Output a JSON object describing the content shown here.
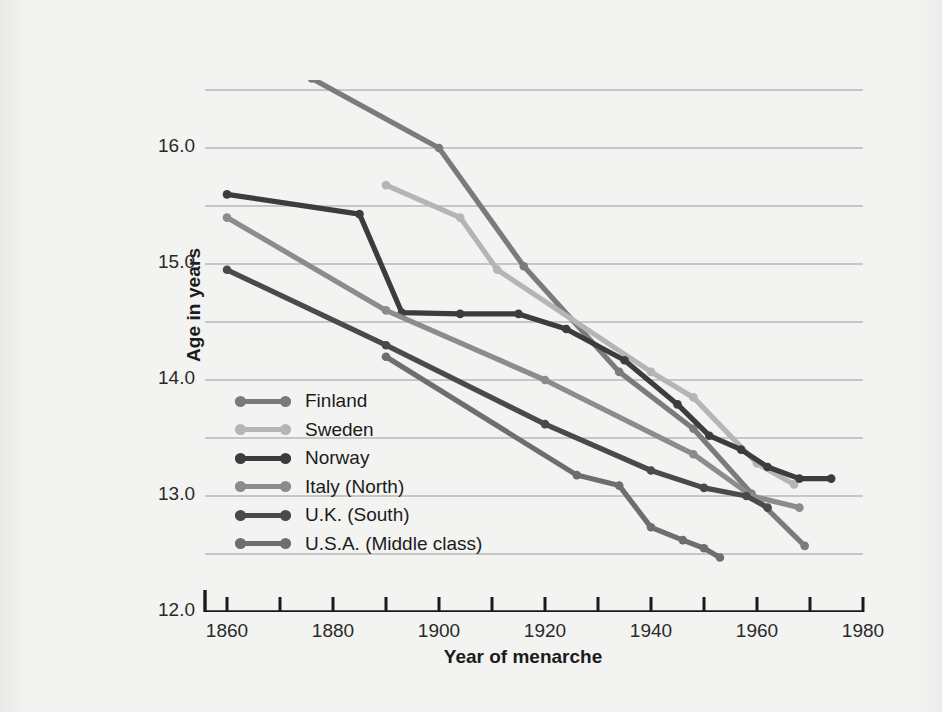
{
  "chart_data": {
    "type": "line",
    "title": "",
    "xlabel": "Year of menarche",
    "ylabel": "Age in years",
    "xlim": [
      1850,
      1980
    ],
    "ylim": [
      12.0,
      16.7
    ],
    "grid": true,
    "legend_position": "inner-left",
    "x_ticks": [
      1860,
      1880,
      1900,
      1920,
      1940,
      1960,
      1980
    ],
    "x_tick_labels": [
      "1860",
      "1880",
      "1900",
      "1920",
      "1940",
      "1960",
      "1980"
    ],
    "x_minor_ticks": [
      1850,
      1870,
      1890,
      1910,
      1930,
      1950,
      1970
    ],
    "y_ticks": [
      12.0,
      13.0,
      14.0,
      15.0,
      16.0
    ],
    "y_tick_labels": [
      "12.0",
      "13.0",
      "14.0",
      "15.0",
      "16.0"
    ],
    "y_gridlines": [
      12.5,
      13.0,
      13.5,
      14.0,
      14.5,
      15.0,
      15.5,
      16.0,
      16.5
    ],
    "series": [
      {
        "name": "Finland",
        "color": "#7b7b7b",
        "points": [
          [
            1876,
            16.6
          ],
          [
            1900,
            16.0
          ],
          [
            1916,
            14.98
          ],
          [
            1934,
            14.07
          ],
          [
            1948,
            13.58
          ],
          [
            1959,
            13.02
          ],
          [
            1969,
            12.57
          ]
        ]
      },
      {
        "name": "Sweden",
        "color": "#b5b5b5",
        "points": [
          [
            1890,
            15.68
          ],
          [
            1904,
            15.4
          ],
          [
            1911,
            14.95
          ],
          [
            1940,
            14.07
          ],
          [
            1948,
            13.85
          ],
          [
            1960,
            13.28
          ],
          [
            1967,
            13.1
          ]
        ]
      },
      {
        "name": "Norway",
        "color": "#3c3c3c",
        "points": [
          [
            1860,
            15.6
          ],
          [
            1885,
            15.43
          ],
          [
            1893,
            14.58
          ],
          [
            1904,
            14.57
          ],
          [
            1915,
            14.57
          ],
          [
            1924,
            14.44
          ],
          [
            1935,
            14.17
          ],
          [
            1945,
            13.79
          ],
          [
            1951,
            13.52
          ],
          [
            1957,
            13.4
          ],
          [
            1962,
            13.25
          ],
          [
            1968,
            13.15
          ],
          [
            1974,
            13.15
          ]
        ]
      },
      {
        "name": "Italy (North)",
        "color": "#8c8c8c",
        "points": [
          [
            1860,
            15.4
          ],
          [
            1890,
            14.6
          ],
          [
            1920,
            14.0
          ],
          [
            1948,
            13.36
          ],
          [
            1959,
            13.0
          ],
          [
            1968,
            12.9
          ]
        ]
      },
      {
        "name": "U.K. (South)",
        "color": "#4a4a4a",
        "points": [
          [
            1860,
            14.95
          ],
          [
            1890,
            14.3
          ],
          [
            1920,
            13.62
          ],
          [
            1940,
            13.22
          ],
          [
            1950,
            13.07
          ],
          [
            1958,
            13.0
          ],
          [
            1962,
            12.9
          ]
        ]
      },
      {
        "name": "U.S.A. (Middle class)",
        "color": "#6e6e6e",
        "points": [
          [
            1890,
            14.2
          ],
          [
            1926,
            13.18
          ],
          [
            1934,
            13.09
          ],
          [
            1940,
            12.73
          ],
          [
            1946,
            12.62
          ],
          [
            1950,
            12.55
          ],
          [
            1953,
            12.47
          ]
        ]
      }
    ]
  },
  "axes": {
    "y_title": "Age in years",
    "x_title": "Year of menarche"
  },
  "legend": {
    "items": [
      {
        "label": "Finland",
        "color": "#7b7b7b"
      },
      {
        "label": "Sweden",
        "color": "#b5b5b5"
      },
      {
        "label": "Norway",
        "color": "#3c3c3c"
      },
      {
        "label": "Italy (North)",
        "color": "#8c8c8c"
      },
      {
        "label": "U.K. (South)",
        "color": "#4a4a4a"
      },
      {
        "label": "U.S.A. (Middle class)",
        "color": "#6e6e6e"
      }
    ]
  },
  "style": {
    "background": "#f3f3f1",
    "gridline_color": "#b9b9b9",
    "axis_color": "#1b1b1b",
    "text_color": "#2a2a2a"
  }
}
